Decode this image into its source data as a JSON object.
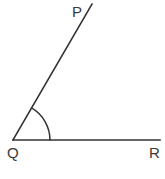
{
  "figure": {
    "type": "geometry-angle-diagram",
    "background_color": "#ffffff",
    "stroke_color": "#333333",
    "label_color": "#3a3a3a",
    "stroke_width": 1.6,
    "canvas": {
      "width": 165,
      "height": 179
    },
    "points": [
      {
        "id": "P",
        "label": "P",
        "x": 92,
        "y": 4,
        "label_x": 72,
        "label_y": 17
      },
      {
        "id": "Q",
        "label": "Q",
        "x": 13,
        "y": 140,
        "label_x": 7,
        "label_y": 158
      },
      {
        "id": "R",
        "label": "R",
        "x": 160,
        "y": 140,
        "label_x": 149,
        "label_y": 158
      }
    ],
    "rays": [
      {
        "id": "QP",
        "name": "ray-qp",
        "from": "Q",
        "to": "P",
        "d": "M 13 140 L 92 4"
      },
      {
        "id": "QR",
        "name": "ray-qr",
        "from": "Q",
        "to": "R",
        "d": "M 13 140 L 160 140"
      }
    ],
    "angle_arc": {
      "id": "angle-PQR",
      "vertex": "Q",
      "radius": 37,
      "start_angle_deg": 0,
      "end_angle_deg": 60,
      "d": "M 50 140 A 37 37 0 0 0 31.5 108"
    },
    "labels": {
      "p": "P",
      "q": "Q",
      "r": "R"
    }
  }
}
